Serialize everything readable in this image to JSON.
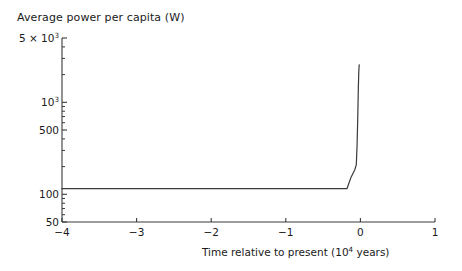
{
  "chart_data": {
    "type": "line",
    "title": "",
    "ylabel": "Average power per capita (W)",
    "xlabel": "Time relative to present (10⁴ years)",
    "xlabel_prefix": "Time relative to present (10",
    "xlabel_exponent": "4",
    "xlabel_suffix": " years)",
    "xlim": [
      -4,
      1
    ],
    "ylim": [
      50,
      5000
    ],
    "yscale": "log",
    "xscale": "linear",
    "grid": false,
    "legend": null,
    "ytick_labels": [
      {
        "value": 5000,
        "text": "5 × 10",
        "exponent": "3"
      },
      {
        "value": 1000,
        "text": "10",
        "exponent": "3"
      },
      {
        "value": 500,
        "text": "500",
        "exponent": ""
      },
      {
        "value": 100,
        "text": "100",
        "exponent": ""
      },
      {
        "value": 50,
        "text": "50",
        "exponent": ""
      }
    ],
    "yticks_minor": [
      60,
      70,
      80,
      90,
      200,
      300,
      400,
      600,
      700,
      800,
      900,
      2000,
      3000,
      4000
    ],
    "xtick_labels": [
      "-4",
      "-3",
      "-2",
      "-1",
      "0",
      "1"
    ],
    "xticks": [
      -4,
      -3,
      -2,
      -1,
      0,
      1
    ],
    "series": [
      {
        "name": "Average power per capita",
        "color": "#3a3a3a",
        "points": [
          [
            -4.0,
            115
          ],
          [
            -0.62,
            115
          ],
          [
            -0.18,
            115
          ],
          [
            -0.16,
            128
          ],
          [
            -0.13,
            150
          ],
          [
            -0.1,
            168
          ],
          [
            -0.075,
            185
          ],
          [
            -0.055,
            210
          ],
          [
            -0.045,
            330
          ],
          [
            -0.035,
            700
          ],
          [
            -0.028,
            1400
          ],
          [
            -0.022,
            2100
          ],
          [
            -0.018,
            2450
          ],
          [
            -0.015,
            2550
          ]
        ]
      }
    ],
    "annotations": []
  }
}
